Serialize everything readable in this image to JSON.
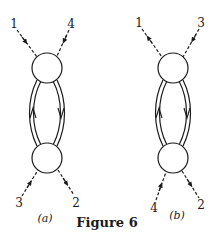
{
  "figure": {
    "caption": "Figure 6",
    "stroke_color": "#1a1a1a",
    "background": "#ffffff"
  },
  "diagrams": [
    {
      "id": "a",
      "sublabel": "(a)",
      "vertices": [
        "top",
        "bottom"
      ],
      "external_lines": [
        {
          "label": "1",
          "attached_to": "top",
          "position": "upper-left",
          "style": "dashed",
          "arrow": "toward vertex"
        },
        {
          "label": "4",
          "attached_to": "top",
          "position": "upper-right",
          "style": "dashed",
          "arrow": "toward vertex"
        },
        {
          "label": "3",
          "attached_to": "bottom",
          "position": "lower-left",
          "style": "dashed",
          "arrow": "toward vertex"
        },
        {
          "label": "2",
          "attached_to": "bottom",
          "position": "lower-right",
          "style": "dashed",
          "arrow": "away from vertex"
        }
      ],
      "internal_lines": [
        {
          "side": "left",
          "style": "double",
          "arrow": "up"
        },
        {
          "side": "right",
          "style": "double",
          "arrow": "down"
        }
      ]
    },
    {
      "id": "b",
      "sublabel": "(b)",
      "vertices": [
        "top",
        "bottom"
      ],
      "external_lines": [
        {
          "label": "1",
          "attached_to": "top",
          "position": "upper-left",
          "style": "dashed",
          "arrow": "away from vertex"
        },
        {
          "label": "3",
          "attached_to": "top",
          "position": "upper-right",
          "style": "dashed",
          "arrow": "toward vertex"
        },
        {
          "label": "4",
          "attached_to": "bottom",
          "position": "lower-left",
          "style": "dashed",
          "arrow": "toward vertex"
        },
        {
          "label": "2",
          "attached_to": "bottom",
          "position": "lower-right",
          "style": "dashed",
          "arrow": "away from vertex"
        }
      ],
      "internal_lines": [
        {
          "side": "left",
          "style": "double",
          "arrow": "up"
        },
        {
          "side": "right",
          "style": "double",
          "arrow": "down"
        }
      ]
    }
  ]
}
